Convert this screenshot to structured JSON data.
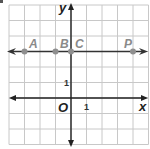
{
  "figure": {
    "type": "coordinate-plane",
    "grid": {
      "x_range": [
        -4,
        5
      ],
      "y_range": [
        -3,
        6
      ],
      "step": 1
    },
    "axes": {
      "x_label": "x",
      "y_label": "y",
      "origin_label": "O",
      "x_tick_label": "1",
      "y_tick_label": "1"
    },
    "line": {
      "y": 3,
      "arrows": "both",
      "color": "#333333"
    },
    "points": [
      {
        "label": "A",
        "x": -3,
        "y": 3
      },
      {
        "label": "B",
        "x": -1,
        "y": 3
      },
      {
        "label": "C",
        "x": 0,
        "y": 3
      },
      {
        "label": "P",
        "x": 4,
        "y": 3
      }
    ],
    "colors": {
      "grid": "#c8c8c8",
      "axis": "#222222",
      "point": "#8f8f8f",
      "point_label": "#8a8a8a"
    }
  }
}
